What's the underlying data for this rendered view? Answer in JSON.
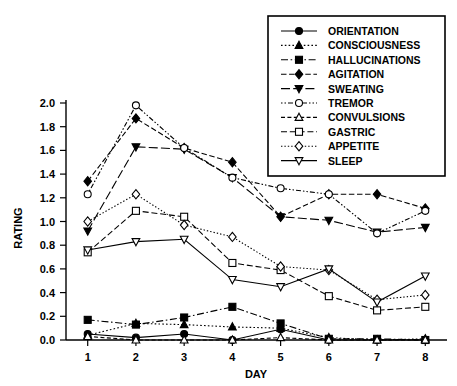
{
  "chart_data": {
    "type": "line",
    "title": "",
    "xlabel": "DAY",
    "ylabel": "RATING",
    "x": [
      1,
      2,
      3,
      4,
      5,
      6,
      7,
      8
    ],
    "categories": [
      "1",
      "2",
      "3",
      "4",
      "5",
      "6",
      "7",
      "8"
    ],
    "xlim": [
      0.55,
      8.45
    ],
    "ylim": [
      0.0,
      2.0
    ],
    "ytick_labels": [
      "0.0",
      "0.2",
      "0.4",
      "0.6",
      "0.8",
      "1.0",
      "1.2",
      "1.4",
      "1.6",
      "1.8",
      "2.0"
    ],
    "yticks": [
      0.0,
      0.2,
      0.4,
      0.6,
      0.8,
      1.0,
      1.2,
      1.4,
      1.6,
      1.8,
      2.0
    ],
    "xtick_labels": [
      "1",
      "2",
      "3",
      "4",
      "5",
      "6",
      "7",
      "8"
    ],
    "grid": false,
    "legend_position": "top-right",
    "series": [
      {
        "name": "ORIENTATION",
        "marker": "filled-circle",
        "linestyle": "solid",
        "dash": "none",
        "values": [
          0.05,
          0.02,
          0.05,
          0.0,
          0.09,
          0.0,
          0.0,
          0.0
        ]
      },
      {
        "name": "CONSCIOUSNESS",
        "marker": "filled-triangle-up",
        "linestyle": "dotted",
        "dash": "1.6,2.2",
        "values": [
          0.04,
          0.14,
          0.13,
          0.11,
          0.1,
          0.02,
          0.0,
          0.01
        ]
      },
      {
        "name": "HALLUCINATIONS",
        "marker": "filled-square",
        "linestyle": "dash-dot",
        "dash": "7,2.6,1.6,2.6",
        "values": [
          0.17,
          0.13,
          0.19,
          0.28,
          0.14,
          0.01,
          0.01,
          0.0
        ]
      },
      {
        "name": "AGITATION",
        "marker": "filled-diamond",
        "linestyle": "dashed",
        "dash": "5.5,2.6",
        "values": [
          1.34,
          1.87,
          1.62,
          1.5,
          1.04,
          1.23,
          1.23,
          1.11
        ]
      },
      {
        "name": "SWEATING",
        "marker": "filled-triangle-down",
        "linestyle": "long-dash",
        "dash": "9,3.2",
        "values": [
          0.92,
          1.63,
          1.61,
          1.37,
          1.04,
          1.01,
          0.91,
          0.95
        ]
      },
      {
        "name": "TREMOR",
        "marker": "open-circle",
        "linestyle": "dotted-dash",
        "dash": "1.5,2,1.5,2,5,2",
        "values": [
          1.23,
          1.98,
          1.62,
          1.37,
          1.28,
          1.23,
          0.9,
          1.09
        ]
      },
      {
        "name": "CONVULSIONS",
        "marker": "open-triangle-up",
        "linestyle": "dashed-small",
        "dash": "4,2.4",
        "values": [
          0.03,
          0.0,
          0.0,
          0.0,
          0.02,
          0.0,
          0.0,
          0.0
        ]
      },
      {
        "name": "GASTRIC",
        "marker": "open-square",
        "linestyle": "dashed-med",
        "dash": "6,2.8",
        "values": [
          0.74,
          1.09,
          1.04,
          0.65,
          0.59,
          0.37,
          0.25,
          0.28
        ]
      },
      {
        "name": "APPETITE",
        "marker": "open-diamond",
        "linestyle": "fine-dotted",
        "dash": "1.4,2",
        "values": [
          1.0,
          1.23,
          0.97,
          0.87,
          0.62,
          0.59,
          0.34,
          0.38
        ]
      },
      {
        "name": "SLEEP",
        "marker": "open-triangle-down",
        "linestyle": "solid",
        "dash": "none",
        "values": [
          0.76,
          0.83,
          0.85,
          0.51,
          0.45,
          0.6,
          0.32,
          0.54
        ]
      }
    ]
  },
  "legend": {
    "entries": [
      "ORIENTATION",
      "CONSCIOUSNESS",
      "HALLUCINATIONS",
      "AGITATION",
      "SWEATING",
      "TREMOR",
      "CONVULSIONS",
      "GASTRIC",
      "APPETITE",
      "SLEEP"
    ]
  },
  "colors": {
    "ink": "#000000",
    "background": "#ffffff"
  }
}
